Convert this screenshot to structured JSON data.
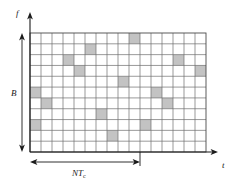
{
  "figure": {
    "axis_labels": {
      "vertical": "f",
      "horizontal": "t"
    },
    "dimension_labels": {
      "bandwidth": "B",
      "hop_period_base": "NT",
      "hop_period_sub": "c"
    },
    "colors": {
      "cell_fill": "#c3c3c3",
      "grid_line": "#6e6e6e",
      "grid_border": "#4a4a4a",
      "axis": "#1a1a1a",
      "background": "#ffffff"
    }
  },
  "chart_data": {
    "type": "heatmap",
    "xlabel": "t",
    "ylabel": "f",
    "columns": 16,
    "rows": 11,
    "grid": true,
    "legend": "none",
    "annotations": [
      {
        "text": "B",
        "axis": "y",
        "kind": "dimension-arrow",
        "span": "full-height"
      },
      {
        "text": "NTc",
        "axis": "x",
        "kind": "dimension-arrow",
        "span_columns": 10
      }
    ],
    "note": "Each shaded cell marks the frequency slot occupied during one hop interval.",
    "hops": [
      {
        "col": 9,
        "row": 0
      },
      {
        "col": 5,
        "row": 1
      },
      {
        "col": 3,
        "row": 2
      },
      {
        "col": 13,
        "row": 2
      },
      {
        "col": 4,
        "row": 3
      },
      {
        "col": 15,
        "row": 3
      },
      {
        "col": 8,
        "row": 4
      },
      {
        "col": 0,
        "row": 5
      },
      {
        "col": 11,
        "row": 5
      },
      {
        "col": 1,
        "row": 6
      },
      {
        "col": 12,
        "row": 6
      },
      {
        "col": 6,
        "row": 7
      },
      {
        "col": 0,
        "row": 8
      },
      {
        "col": 10,
        "row": 8
      },
      {
        "col": 7,
        "row": 9
      }
    ],
    "hop_sequence_by_time": [
      {
        "col": 0,
        "row": 5
      },
      {
        "col": 0,
        "row": 8
      },
      {
        "col": 1,
        "row": 6
      },
      {
        "col": 3,
        "row": 2
      },
      {
        "col": 4,
        "row": 3
      },
      {
        "col": 5,
        "row": 1
      },
      {
        "col": 6,
        "row": 7
      },
      {
        "col": 7,
        "row": 9
      },
      {
        "col": 8,
        "row": 4
      },
      {
        "col": 9,
        "row": 0
      },
      {
        "col": 10,
        "row": 8
      },
      {
        "col": 11,
        "row": 5
      },
      {
        "col": 12,
        "row": 6
      },
      {
        "col": 13,
        "row": 2
      },
      {
        "col": 15,
        "row": 3
      }
    ]
  }
}
